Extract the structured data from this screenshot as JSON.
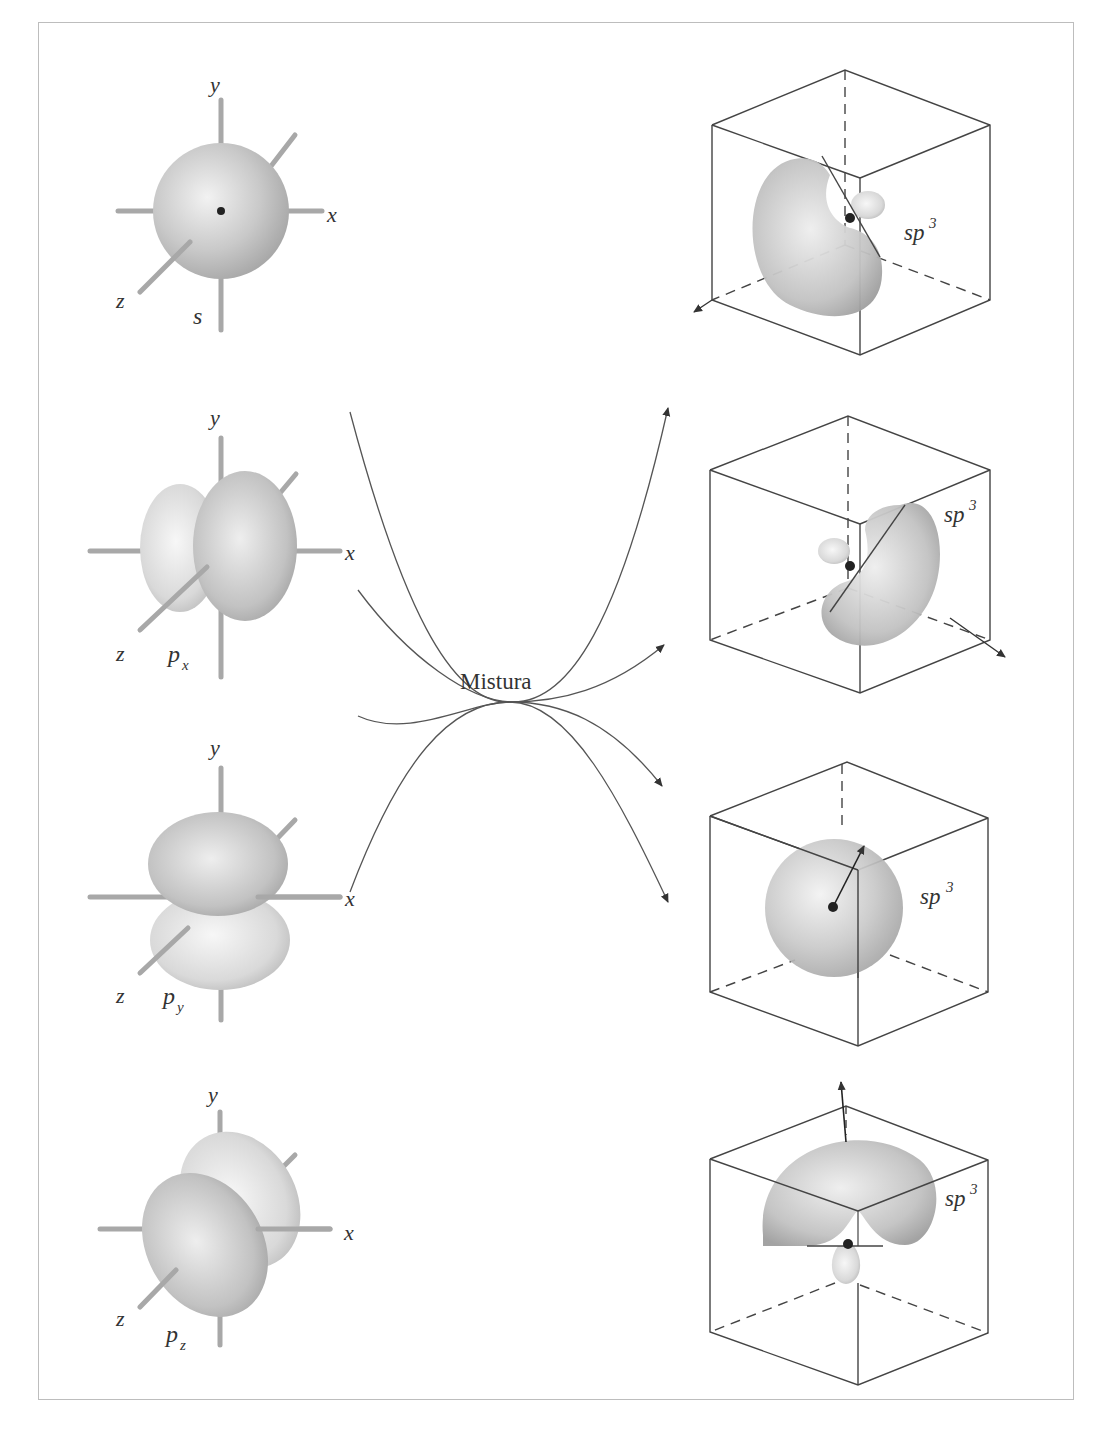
{
  "diagram": {
    "center_label": "Mistura",
    "axis_labels": {
      "x": "x",
      "y": "y",
      "z": "z"
    },
    "atomic_orbitals": [
      {
        "id": "s",
        "label": "s",
        "sub": ""
      },
      {
        "id": "px",
        "label": "p",
        "sub": "x"
      },
      {
        "id": "py",
        "label": "p",
        "sub": "y"
      },
      {
        "id": "pz",
        "label": "p",
        "sub": "z"
      }
    ],
    "hybrid_orbitals": [
      {
        "label": "sp",
        "sup": "3"
      },
      {
        "label": "sp",
        "sup": "3"
      },
      {
        "label": "sp",
        "sup": "3"
      },
      {
        "label": "sp",
        "sup": "3"
      }
    ],
    "colors": {
      "orbital": "#c8c8c8",
      "line": "#444444",
      "frame": "#bdbdbd",
      "axis": "#a8a8a8"
    }
  }
}
